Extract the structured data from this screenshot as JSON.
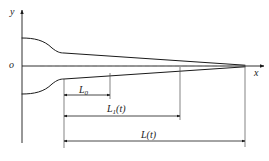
{
  "figure": {
    "background_color": "#ffffff",
    "line_color": "#1a1a1a",
    "centerline_color": "#8c8c8c",
    "axes": {
      "y_axis_label": "y",
      "x_axis_label": "x",
      "origin_label": "o"
    },
    "dimensions": [
      {
        "id": "L0",
        "label_main": "L",
        "label_sub": "0",
        "label_paren": "",
        "start_x": 64,
        "end_x": 110,
        "line_y": 95
      },
      {
        "id": "L1",
        "label_main": "L",
        "label_sub": "1",
        "label_paren": "(t)",
        "start_x": 64,
        "end_x": 180,
        "line_y": 116
      },
      {
        "id": "L",
        "label_main": "L",
        "label_sub": "",
        "label_paren": "(t)",
        "start_x": 64,
        "end_x": 245,
        "line_y": 141
      }
    ],
    "geometry": {
      "origin_x": 22,
      "centerline_y": 66,
      "tip_x": 245,
      "kink_x": 64,
      "bulge_half_width": 28,
      "kink_half_width": 13
    }
  }
}
